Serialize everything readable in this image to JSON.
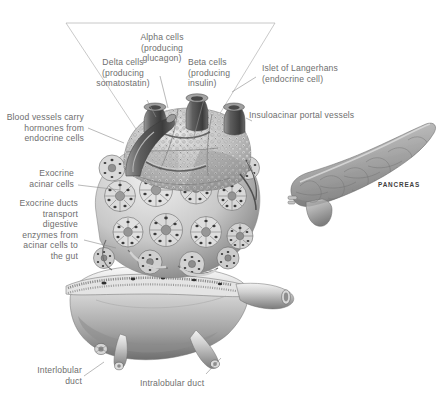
{
  "figure": {
    "background_color": "#ffffff",
    "label_color": "#6e6e6e",
    "leader_color": "#8e8e8e",
    "caption_color": "#3f3f3f"
  },
  "labels": {
    "alpha_cells": "Alpha cells\n(producing\nglucagon)",
    "delta_cells": "Delta cells\n(producing\nsomatostatin)",
    "beta_cells": "Beta cells\n(producing\ninsulin)",
    "islet": "Islet of Langerhans\n(endocrine cell)",
    "insuloacinar": "Insuloacinar portal vessels",
    "blood_vessels": "Blood vessels carry\nhormones from\nendocrine cells",
    "exocrine_acinar": "Exocrine\nacinar cells",
    "exocrine_ducts": "Exocrine ducts\ntransport\ndigestive\nenzymes from\nacinar cells to\nthe gut",
    "interlobular": "Interlobular\nduct",
    "intralobular": "Intralobular duct",
    "pancreas_caption": "PANCREAS"
  }
}
